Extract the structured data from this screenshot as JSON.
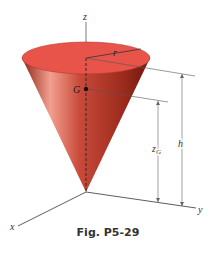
{
  "figure": {
    "caption": "Fig. P5-29",
    "labels": {
      "z_axis": "z",
      "x_axis": "x",
      "y_axis": "y",
      "radius": "r",
      "centroid": "G",
      "height": "h",
      "z_G": "z",
      "z_G_sub": "G"
    },
    "colors": {
      "cone_top": "#e8534a",
      "cone_body": "#c0392b",
      "cone_dark": "#7a1a12",
      "lines": "#444444"
    }
  }
}
